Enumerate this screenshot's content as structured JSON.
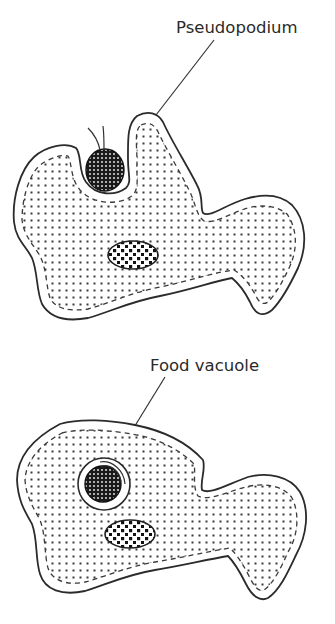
{
  "diagram": {
    "panels": [
      {
        "id": "top",
        "stage": "Pseudopodia surround food particle",
        "label": "Pseudopodium",
        "label_position": [
          162,
          29
        ],
        "leader_from": [
          214,
          38
        ],
        "leader_to": [
          156,
          115
        ]
      },
      {
        "id": "bottom",
        "stage": "Food enclosed in food vacuole",
        "label": "Food vacuole",
        "label_position": [
          148,
          367
        ],
        "leader_from": [
          165,
          375
        ],
        "leader_to": [
          116,
          455
        ]
      }
    ],
    "parts": [
      "cell membrane",
      "ectoplasm boundary (dashed)",
      "cytoplasm (dotted)",
      "nucleus",
      "food particle",
      "flagellum-like tail"
    ],
    "colors": {
      "stroke": "#2b2b2b",
      "food_fill": "#1a1a1a",
      "background": "#ffffff"
    }
  }
}
